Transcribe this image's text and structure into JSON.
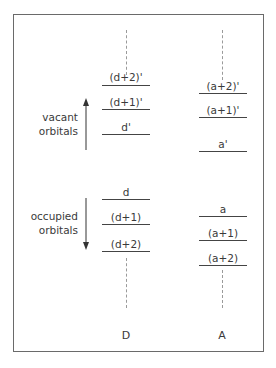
{
  "diagram": {
    "side_labels": {
      "vacant": [
        "vacant",
        "orbitals"
      ],
      "occupied": [
        "occupied",
        "orbitals"
      ]
    },
    "columns": [
      {
        "label": "D",
        "vacant_levels": [
          "(d+2)'",
          "(d+1)'",
          "d'"
        ],
        "occupied_levels": [
          "d",
          "(d+1)",
          "(d+2)"
        ]
      },
      {
        "label": "A",
        "vacant_levels": [
          "(a+2)'",
          "(a+1)'",
          "a'"
        ],
        "occupied_levels": [
          "a",
          "(a+1)",
          "(a+2)"
        ]
      }
    ],
    "arrows": {
      "vacant_direction": "up",
      "occupied_direction": "down"
    }
  }
}
